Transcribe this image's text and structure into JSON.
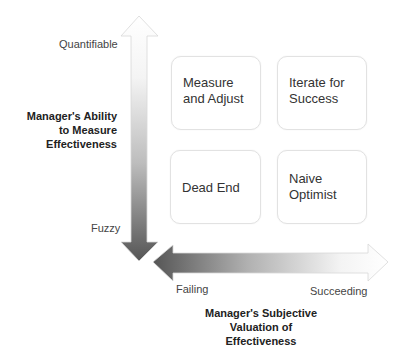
{
  "y_axis": {
    "title": "Manager's Ability to Measure Effectiveness",
    "title_lines": [
      "Manager's Ability",
      "to Measure",
      "Effectiveness"
    ],
    "top_label": "Quantifiable",
    "bottom_label": "Fuzzy"
  },
  "x_axis": {
    "title": "Manager's Subjective Valuation of Effectiveness",
    "title_lines": [
      "Manager's Subjective",
      "Valuation of",
      "Effectiveness"
    ],
    "left_label": "Failing",
    "right_label": "Succeeding"
  },
  "quadrants": [
    {
      "position": "top-left",
      "lines": [
        "Measure",
        "and Adjust"
      ]
    },
    {
      "position": "top-right",
      "lines": [
        "Iterate for",
        "Success"
      ]
    },
    {
      "position": "bottom-left",
      "lines": [
        "Dead End"
      ]
    },
    {
      "position": "bottom-right",
      "lines": [
        "Naive",
        "Optimist"
      ]
    }
  ],
  "colors": {
    "arrow_dark": "#555555",
    "arrow_light": "#ffffff",
    "box_border": "#e2e2e2"
  }
}
